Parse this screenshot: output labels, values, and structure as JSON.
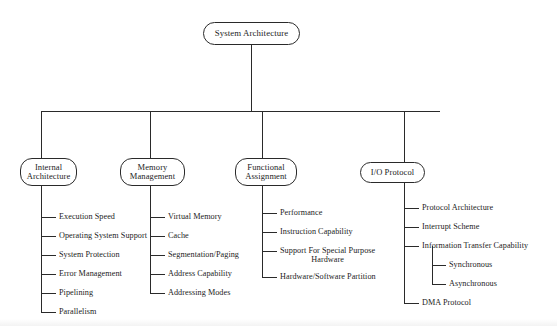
{
  "diagram": {
    "title": "System Architecture",
    "type": "tree",
    "root": {
      "label": "System Architecture",
      "box": {
        "x": 203,
        "y": 22,
        "w": 97,
        "h": 23
      }
    },
    "branches": [
      {
        "id": "internal-architecture",
        "label": "Internal\nArchitecture",
        "box": {
          "x": 20,
          "y": 158,
          "w": 57,
          "h": 28
        },
        "trunk_x": 41,
        "leaf_x": 56,
        "text_x": 59,
        "leaves": [
          {
            "label": "Execution Speed",
            "y": 217
          },
          {
            "label": "Operating System Support",
            "y": 236
          },
          {
            "label": "System Protection",
            "y": 255
          },
          {
            "label": "Error Management",
            "y": 274
          },
          {
            "label": "Pipelining",
            "y": 293
          },
          {
            "label": "Parallelism",
            "y": 312
          }
        ]
      },
      {
        "id": "memory-management",
        "label": "Memory\nManagement",
        "box": {
          "x": 120,
          "y": 158,
          "w": 65,
          "h": 28
        },
        "trunk_x": 150,
        "leaf_x": 165,
        "text_x": 168,
        "leaves": [
          {
            "label": "Virtual Memory",
            "y": 217
          },
          {
            "label": "Cache",
            "y": 236
          },
          {
            "label": "Segmentation/Paging",
            "y": 255
          },
          {
            "label": "Address Capability",
            "y": 274
          },
          {
            "label": "Addressing Modes",
            "y": 293
          }
        ]
      },
      {
        "id": "functional-assignment",
        "label": "Functional\nAssignment",
        "box": {
          "x": 235,
          "y": 158,
          "w": 62,
          "h": 28
        },
        "trunk_x": 262,
        "leaf_x": 277,
        "text_x": 280,
        "leaves": [
          {
            "label": "Performance",
            "y": 213
          },
          {
            "label": "Instruction Capability",
            "y": 232
          },
          {
            "label": "Support For Special Purpose\nHardware",
            "y": 251,
            "multiline": true
          },
          {
            "label": "Hardware/Software Partition",
            "y": 277
          }
        ]
      },
      {
        "id": "io-protocol",
        "label": "I/O Protocol",
        "box": {
          "x": 360,
          "y": 162,
          "w": 65,
          "h": 21
        },
        "trunk_x": 404,
        "leaf_x": 419,
        "text_x": 422,
        "leaves": [
          {
            "label": "Protocol Architecture",
            "y": 208
          },
          {
            "label": "Interrupt Scheme",
            "y": 227
          },
          {
            "label": "Information Transfer Capability",
            "y": 246
          },
          {
            "label": "DMA Protocol",
            "y": 303
          }
        ],
        "subbranch": {
          "parent": "Information Transfer Capability",
          "trunk_x": 432,
          "leaf_x": 446,
          "text_x": 449,
          "leaves": [
            {
              "label": "Synchronous",
              "y": 265
            },
            {
              "label": "Asynchronous",
              "y": 284
            }
          ]
        }
      }
    ],
    "bus": {
      "y": 111,
      "x_start": 41,
      "x_end": 440,
      "root_drop_x": 251
    },
    "colors": {
      "stroke": "#2a2a2a",
      "text": "#1c1c1c",
      "background": "#ffffff"
    }
  }
}
